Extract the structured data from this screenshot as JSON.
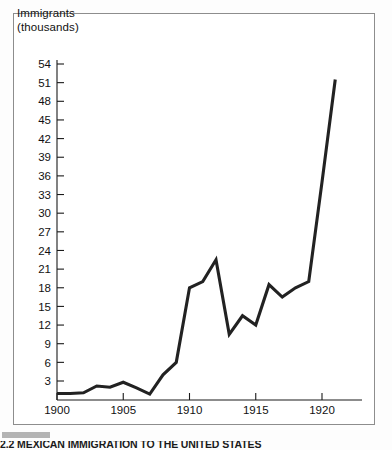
{
  "figure": {
    "caption": "2.2  MEXICAN IMMIGRATION TO THE UNITED STATES",
    "frame_color": "#8d8d8d",
    "background": "#ffffff"
  },
  "chart_data": {
    "type": "line",
    "title": "",
    "ylabel_line1": "Immigrants",
    "ylabel_line2": "(thousands)",
    "xlabel": "",
    "xlim": [
      1900,
      1922
    ],
    "ylim": [
      0,
      55.5
    ],
    "grid": false,
    "legend": "none",
    "line_color": "#222222",
    "yticks": [
      3,
      6,
      9,
      12,
      15,
      18,
      21,
      24,
      27,
      30,
      33,
      36,
      39,
      42,
      45,
      48,
      51,
      54
    ],
    "ytick_labels": [
      "3",
      "6",
      "9",
      "12",
      "15",
      "18",
      "21",
      "24",
      "27",
      "30",
      "33",
      "36",
      "39",
      "42",
      "45",
      "48",
      "51",
      "54"
    ],
    "xticks": [
      1900,
      1905,
      1910,
      1915,
      1920
    ],
    "xtick_labels": [
      "1900",
      "1905",
      "1910",
      "1915",
      "1920"
    ],
    "x": [
      1900,
      1901,
      1902,
      1903,
      1904,
      1905,
      1906,
      1907,
      1908,
      1909,
      1910,
      1911,
      1912,
      1913,
      1914,
      1915,
      1916,
      1917,
      1918,
      1919,
      1920,
      1921
    ],
    "values": [
      1.0,
      1.0,
      1.1,
      2.2,
      2.0,
      2.8,
      1.9,
      0.9,
      4.0,
      6.0,
      18.0,
      19.0,
      22.5,
      10.5,
      13.5,
      12.0,
      18.5,
      16.5,
      18.0,
      19.0,
      35.0,
      51.5
    ],
    "series_name": "Mexican immigrants"
  }
}
